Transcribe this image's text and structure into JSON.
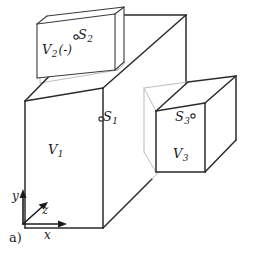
{
  "figure": {
    "label": "a)",
    "background_color": "#ffffff",
    "line_color": "#2b2b2b",
    "hidden_line_color": "#b6b6b6"
  },
  "solids": [
    {
      "name": "main-slab",
      "volume_label": "V",
      "volume_subscript": "1",
      "surface_label": "S",
      "surface_subscript": "1",
      "marker_side": "left"
    },
    {
      "name": "top-box",
      "volume_label": "V",
      "volume_subscript": "2",
      "volume_suffix": "(-)",
      "surface_label": "S",
      "surface_subscript": "2",
      "marker_side": "left"
    },
    {
      "name": "right-box",
      "volume_label": "V",
      "volume_subscript": "3",
      "surface_label": "S",
      "surface_subscript": "3",
      "marker_side": "right"
    }
  ],
  "labels": {
    "v1": "V",
    "v1_sub": "1",
    "v2": "V",
    "v2_sub": "2",
    "v2_suffix": "(-)",
    "v3": "V",
    "v3_sub": "3",
    "s1": "S",
    "s1_sub": "1",
    "s2": "S",
    "s2_sub": "2",
    "s3": "S",
    "s3_sub": "3"
  },
  "axes": {
    "origin_label": "",
    "x_label": "x",
    "y_label": "y",
    "z_label": "z"
  }
}
